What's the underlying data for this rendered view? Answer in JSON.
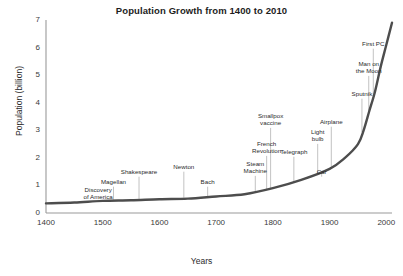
{
  "chart_data": {
    "type": "line",
    "title": "Population Growth from 1400 to 2010",
    "xlabel": "Years",
    "ylabel": "Population (billion)",
    "xlim": [
      1400,
      2010
    ],
    "ylim": [
      0,
      7
    ],
    "grid": false,
    "legend": "none",
    "line_color": "#4d4d4d",
    "annotation_line_color": "#b3b3b3",
    "axis_color": "#808080",
    "xticks": [
      1400,
      1500,
      1600,
      1700,
      1800,
      1900,
      2000
    ],
    "yticks": [
      0,
      1,
      2,
      3,
      4,
      5,
      6,
      7
    ],
    "x": [
      1400,
      1450,
      1500,
      1550,
      1600,
      1650,
      1700,
      1750,
      1800,
      1850,
      1900,
      1927,
      1950,
      1960,
      1970,
      1980,
      1990,
      2000,
      2010
    ],
    "values": [
      0.35,
      0.38,
      0.44,
      0.46,
      0.5,
      0.52,
      0.6,
      0.68,
      0.9,
      1.2,
      1.6,
      2.0,
      2.5,
      3.0,
      3.7,
      4.4,
      5.3,
      6.1,
      6.9
    ],
    "annotations": [
      {
        "label": "Discovery\nof America",
        "year": 1492,
        "value": 0.44
      },
      {
        "label": "Magellan",
        "year": 1519,
        "value": 0.45
      },
      {
        "label": "Shakespeare",
        "year": 1564,
        "value": 0.47
      },
      {
        "label": "Newton",
        "year": 1643,
        "value": 0.52
      },
      {
        "label": "Bach",
        "year": 1685,
        "value": 0.58
      },
      {
        "label": "Steam\nMachine",
        "year": 1769,
        "value": 0.72
      },
      {
        "label": "French\nRevolution",
        "year": 1789,
        "value": 0.8
      },
      {
        "label": "Smallpox\nvaccine",
        "year": 1796,
        "value": 0.82
      },
      {
        "label": "Telegraph",
        "year": 1837,
        "value": 1.05
      },
      {
        "label": "Car",
        "year": 1886,
        "value": 1.4
      },
      {
        "label": "Light\nbulb",
        "year": 1879,
        "value": 1.35
      },
      {
        "label": "Airplane",
        "year": 1903,
        "value": 1.65
      },
      {
        "label": "Sputnik",
        "year": 1957,
        "value": 2.9
      },
      {
        "label": "Man on\nthe Moon",
        "year": 1969,
        "value": 3.6
      },
      {
        "label": "First PC",
        "year": 1977,
        "value": 4.2
      }
    ]
  }
}
